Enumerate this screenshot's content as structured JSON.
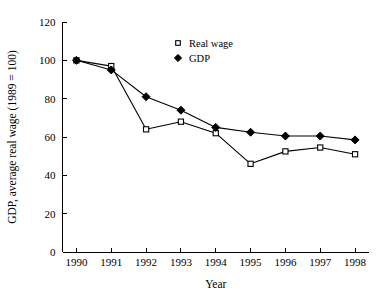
{
  "chart_data": {
    "type": "line",
    "title": "",
    "xlabel": "Year",
    "ylabel": "GDP, average real wage (1989 = 100)",
    "categories": [
      "1990",
      "1991",
      "1992",
      "1993",
      "1994",
      "1995",
      "1996",
      "1997",
      "1998"
    ],
    "x": [
      1990,
      1991,
      1992,
      1993,
      1994,
      1995,
      1996,
      1997,
      1998
    ],
    "xlim": [
      1989.6,
      1998.4
    ],
    "ylim": [
      0,
      120
    ],
    "yticks": [
      "0",
      "20",
      "40",
      "60",
      "80",
      "100",
      "120"
    ],
    "ytick_values": [
      0,
      20,
      40,
      60,
      80,
      100,
      120
    ],
    "grid": false,
    "legend_position": "top-center",
    "series": [
      {
        "name": "Real wage",
        "marker": "open-square",
        "values": [
          100,
          97,
          64,
          68,
          62,
          46,
          52.5,
          54.5,
          51
        ]
      },
      {
        "name": "GDP",
        "marker": "filled-diamond",
        "values": [
          100,
          95,
          81,
          74,
          65,
          62.5,
          60.5,
          60.5,
          58.5
        ]
      }
    ]
  },
  "legend": {
    "items": [
      {
        "label": "Real wage",
        "marker": "open-square"
      },
      {
        "label": "GDP",
        "marker": "filled-diamond"
      }
    ]
  }
}
